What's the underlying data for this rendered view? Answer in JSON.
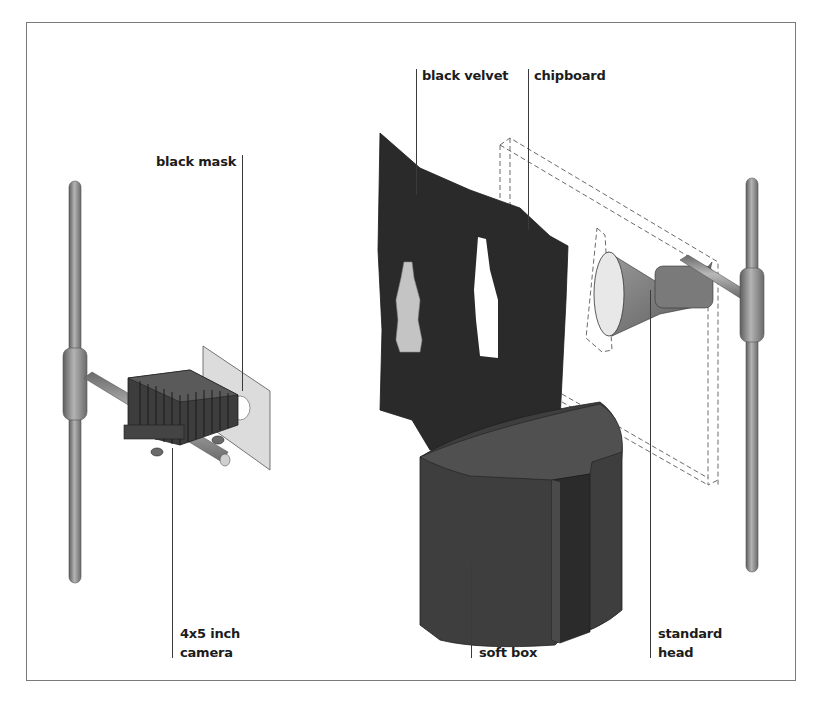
{
  "figure": {
    "type": "lighting setup diagram",
    "labels": {
      "black_mask": "black mask",
      "black_velvet": "black velvet",
      "chipboard": "chipboard",
      "camera_line1": "4x5 inch",
      "camera_line2": "camera",
      "soft_box": "soft box",
      "standard_head_line1": "standard",
      "standard_head_line2": "head"
    },
    "colors": {
      "frame_border": "#7a7a7a",
      "stand_metal": "#8a8a8a",
      "velvet": "#2a2a2a",
      "softbox": "#3e3e3e",
      "mask": "#d9d9d9",
      "bottle": "#c4c4c4",
      "leader_line": "#3a3a3a"
    }
  }
}
